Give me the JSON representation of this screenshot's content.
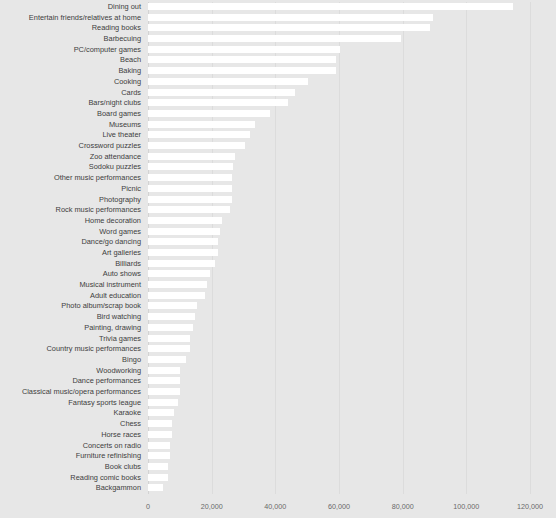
{
  "chart_data": {
    "type": "bar",
    "orientation": "horizontal",
    "title": "",
    "xlabel": "",
    "ylabel": "",
    "xlim": [
      0,
      120000
    ],
    "grid": true,
    "legend": false,
    "xticks": [
      "0",
      "20,000",
      "40,000",
      "60,000",
      "80,000",
      "100,000",
      "120,000"
    ],
    "xtick_values": [
      0,
      20000,
      40000,
      60000,
      80000,
      100000,
      120000
    ],
    "bar_color": "#ffffff",
    "background_color": "#e7e7e7",
    "gridline_color": "#dcdcdc",
    "categories": [
      "Dining out",
      "Entertain friends/relatives at home",
      "Reading books",
      "Barbecuing",
      "PC/computer games",
      "Beach",
      "Baking",
      "Cooking",
      "Cards",
      "Bars/night clubs",
      "Board games",
      "Museums",
      "Live theater",
      "Crossword puzzles",
      "Zoo attendance",
      "Sodoku puzzles",
      "Other music performances",
      "Picnic",
      "Photography",
      "Rock music performances",
      "Home decoration",
      "Word games",
      "Dance/go dancing",
      "Art galleries",
      "Billiards",
      "Auto shows",
      "Musical instrument",
      "Adult education",
      "Photo album/scrap book",
      "Bird watching",
      "Painting, drawing",
      "Trivia games",
      "Country music performances",
      "Bingo",
      "Woodworking",
      "Dance performances",
      "Classical music/opera performances",
      "Fantasy sports league",
      "Karaoke",
      "Chess",
      "Horse races",
      "Concerts on radio",
      "Furniture refinishing",
      "Book clubs",
      "Reading comic books",
      "Backgammon"
    ],
    "values": [
      114700,
      89500,
      88600,
      79500,
      60300,
      59100,
      59000,
      50300,
      46200,
      44000,
      38300,
      33600,
      32000,
      30400,
      27300,
      26700,
      26400,
      26400,
      26300,
      25800,
      23200,
      22600,
      22000,
      21900,
      21100,
      19500,
      18500,
      17900,
      15400,
      14800,
      14200,
      13200,
      13100,
      11800,
      10200,
      10100,
      10000,
      9400,
      8200,
      7500,
      7400,
      6900,
      6800,
      6300,
      6200,
      4700
    ]
  }
}
